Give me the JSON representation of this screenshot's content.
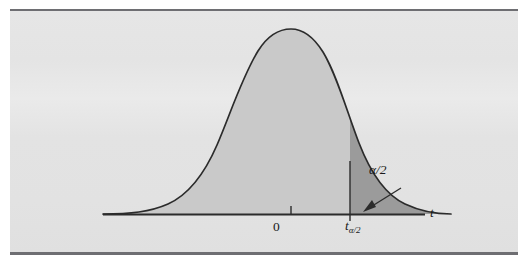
{
  "figure": {
    "kind": "t-distribution-density-with-upper-tail",
    "running_head": "",
    "panel": {
      "background_color": "#e4e4e4",
      "rule_color": "#6e6e72"
    },
    "curve": {
      "stroke_color": "#2b2b2b",
      "body_fill_color": "#c9c9c9",
      "tail_fill_color": "#9a9a9a",
      "peak_x_label": "0"
    },
    "axis": {
      "line_color": "#2b2b2b",
      "label": "t",
      "ticks": [
        {
          "name": "center-tick",
          "label": "0"
        },
        {
          "name": "critical-value-tick",
          "label": "t",
          "subscript": "α/2"
        }
      ]
    },
    "annotations": [
      {
        "name": "tail-area-label",
        "text": "α/2",
        "points_to": "upper-tail-region"
      }
    ]
  }
}
